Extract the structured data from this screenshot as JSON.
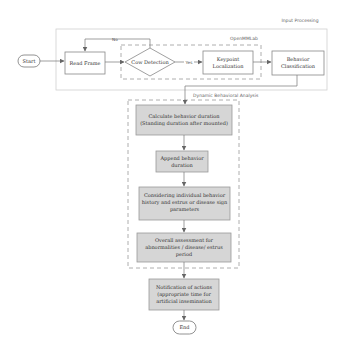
{
  "groups": {
    "input_processing": {
      "label": "Input Processing"
    },
    "openmmlab": {
      "label": "OpenMMLab"
    },
    "dynamic_analysis": {
      "label": "Dynamic Behavioral Analysis"
    }
  },
  "nodes": {
    "start": {
      "label": "Start"
    },
    "read_frame": {
      "label": "Read Frame"
    },
    "cow_detection": {
      "label": "Cow Detection"
    },
    "keypoint": {
      "line1": "Keypoint",
      "line2": "Localization"
    },
    "behavior_class": {
      "line1": "Behavior",
      "line2": "Classification"
    },
    "calc_duration": {
      "line1": "Calculate behavior duration",
      "line2": "(Standing duration after mounted)"
    },
    "append_duration": {
      "line1": "Append behavior",
      "line2": "duration"
    },
    "considering": {
      "line1": "Considering individual behavior",
      "line2": "history and estrus or disease sign",
      "line3": "parameters"
    },
    "overall": {
      "line1": "Overall assessment for",
      "line2": "abnormalities / disease/ estrus",
      "line3": "period"
    },
    "notification": {
      "line1": "Notification of actions",
      "line2": "(appropriate time for",
      "line3": "artificial insemination"
    },
    "end": {
      "label": "End"
    }
  },
  "edges": {
    "no_label": "No",
    "yes_label": "Yes"
  },
  "colors": {
    "stroke": "#777777",
    "process_fill": "#d6d6d6",
    "process_stroke": "#999999",
    "white_box_fill": "#ffffff",
    "group_stroke": "#cccccc",
    "dashed_stroke": "#999999"
  }
}
